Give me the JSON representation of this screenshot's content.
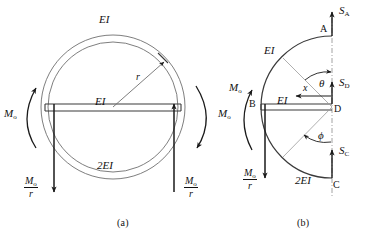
{
  "figure": {
    "title_a": "(a)",
    "title_b": "(b)",
    "stroke_color": "#1a1a1a",
    "thin_color": "#8a8a8a",
    "background": "#ffffff"
  },
  "panel_a": {
    "caption": "(a)",
    "labels": {
      "top_stiffness": "EI",
      "mid_stiffness": "EI",
      "bottom_stiffness": "2EI",
      "radius": "r",
      "moment_left": "M",
      "moment_left_sub": "o",
      "moment_right": "M",
      "moment_right_sub": "o",
      "shear_left_num": "M",
      "shear_left_num_sub": "o",
      "shear_left_den": "r",
      "shear_right_num": "M",
      "shear_right_num_sub": "o",
      "shear_right_den": "r"
    }
  },
  "panel_b": {
    "caption": "(b)",
    "labels": {
      "point_a": "A",
      "point_b": "B",
      "point_c": "C",
      "point_d": "D",
      "reaction_a": "S",
      "reaction_a_sub": "A",
      "reaction_c": "S",
      "reaction_c_sub": "C",
      "reaction_d": "S",
      "reaction_d_sub": "D",
      "angle_theta": "θ",
      "angle_phi": "ϕ",
      "coord_x": "x",
      "top_stiffness": "EI",
      "mid_stiffness": "EI",
      "bottom_stiffness": "2EI",
      "moment": "M",
      "moment_sub": "o",
      "shear_num": "M",
      "shear_num_sub": "o",
      "shear_den": "r"
    }
  }
}
